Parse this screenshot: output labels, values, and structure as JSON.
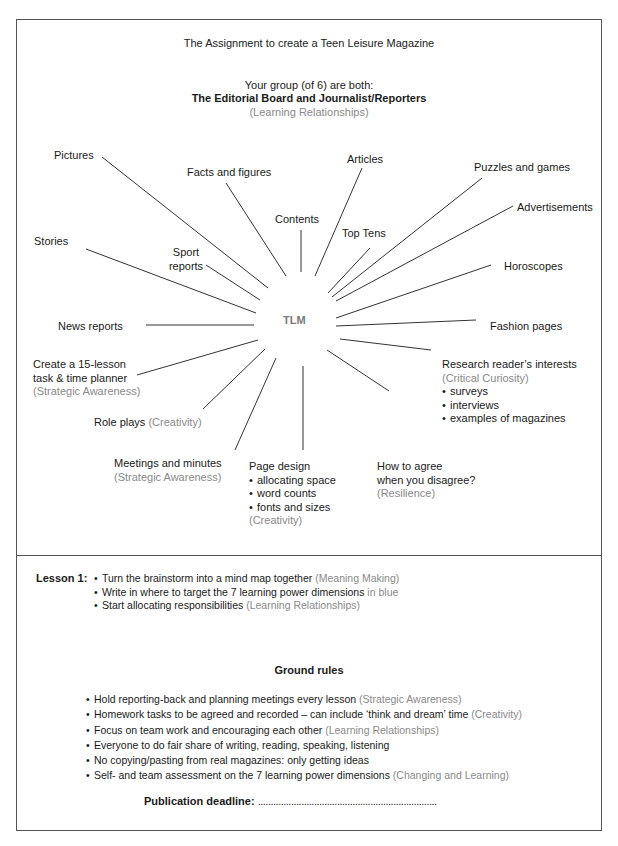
{
  "header": {
    "title": "The Assignment to create a Teen Leisure Magazine",
    "group_line": "Your group (of 6) are both:",
    "role_line": "The Editorial Board and Journalist/Reporters",
    "role_dimension": "(Learning Relationships)"
  },
  "mindmap": {
    "center": "TLM",
    "nodes": {
      "pictures": "Pictures",
      "facts": "Facts and figures",
      "contents": "Contents",
      "articles": "Articles",
      "puzzles": "Puzzles and games",
      "advertisements": "Advertisements",
      "top_tens": "Top Tens",
      "stories": "Stories",
      "sport_1": "Sport",
      "sport_2": "reports",
      "horoscopes": "Horoscopes",
      "news": "News reports",
      "fashion": "Fashion pages",
      "planner_1": "Create a 15-lesson",
      "planner_2": "task & time planner",
      "planner_dim": "(Strategic Awareness)",
      "research": "Research reader’s interests",
      "research_dim": "(Critical Curiosity)",
      "research_items": [
        "surveys",
        "interviews",
        "examples of magazines"
      ],
      "role_plays": "Role plays",
      "role_plays_dim": "(Creativity)",
      "meetings": "Meetings and minutes",
      "meetings_dim": "(Strategic Awareness)",
      "page_design": "Page design",
      "page_design_items": [
        "allocating space",
        "word counts",
        "fonts and sizes"
      ],
      "page_design_dim": "(Creativity)",
      "agree_1": "How to agree",
      "agree_2": "when you disagree?",
      "agree_dim": "(Resilience)"
    }
  },
  "lesson1": {
    "label": "Lesson 1:",
    "items": [
      {
        "text": "Turn the brainstorm into a mind map together",
        "dim": " (Meaning Making)"
      },
      {
        "text": "Write in where to target the 7 learning power dimensions",
        "dim": " in blue"
      },
      {
        "text": "Start allocating responsibilities",
        "dim": " (Learning Relationships)"
      }
    ]
  },
  "ground_rules": {
    "title": "Ground rules",
    "items": [
      {
        "text": "Hold reporting-back and planning meetings every lesson",
        "dim": " (Strategic Awareness)"
      },
      {
        "text": "Homework tasks to be agreed and recorded – can include ‘think and dream’ time",
        "dim": " (Creativity)"
      },
      {
        "text": "Focus on team work and encouraging each other",
        "dim": " (Learning Relationships)"
      },
      {
        "text": "Everyone to do fair share of writing, reading, speaking, listening",
        "dim": ""
      },
      {
        "text": "No copying/pasting from real magazines: only getting ideas",
        "dim": ""
      },
      {
        "text": "Self- and team assessment on the 7 learning power dimensions",
        "dim": " (Changing and Learning)"
      }
    ]
  },
  "deadline": {
    "label": "Publication deadline:",
    "blank": "......................................................................"
  },
  "colors": {
    "text": "#1a1a1a",
    "dimension_grey": "#8a8a8a",
    "tlm_grey": "#7a7a7a",
    "border": "#555555"
  }
}
